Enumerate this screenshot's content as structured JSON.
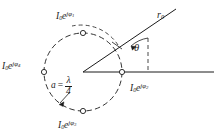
{
  "figure": {
    "type": "phasor-array-diagram",
    "stroke_color": "#1b1b1b",
    "background": "#ffffff",
    "circle": {
      "center_x": 83,
      "center_y": 72,
      "radius": 39,
      "style": "dashed"
    },
    "spacing_label": {
      "variable": "a",
      "equals": "=",
      "numerator": "λ",
      "denominator": "4"
    },
    "ray": {
      "label": "r",
      "label_sub": "0",
      "tip_x": 176,
      "tip_y": 9
    },
    "angle": {
      "label": "θ",
      "degrees": 34
    },
    "elements": [
      {
        "id": "phi1",
        "position": "top",
        "base": "I",
        "base_sub": "0",
        "factor": "e",
        "exp_j": "jφ",
        "exp_sub": "1",
        "marker_x": 83,
        "marker_y": 33,
        "label_x": 56,
        "label_y": 11
      },
      {
        "id": "phi2",
        "position": "right",
        "base": "I",
        "base_sub": "0",
        "factor": "e",
        "exp_j": "jφ",
        "exp_sub": "2",
        "marker_x": 122,
        "marker_y": 72,
        "label_x": 130,
        "label_y": 83
      },
      {
        "id": "phi3",
        "position": "bottom",
        "base": "I",
        "base_sub": "0",
        "factor": "e",
        "exp_j": "jφ",
        "exp_sub": "3",
        "marker_x": 83,
        "marker_y": 111,
        "label_x": 58,
        "label_y": 120
      },
      {
        "id": "phi4",
        "position": "left",
        "base": "I",
        "base_sub": "0",
        "factor": "e",
        "exp_j": "jφ",
        "exp_sub": "4",
        "marker_x": 44,
        "marker_y": 72,
        "label_x": 2,
        "label_y": 61
      }
    ]
  }
}
